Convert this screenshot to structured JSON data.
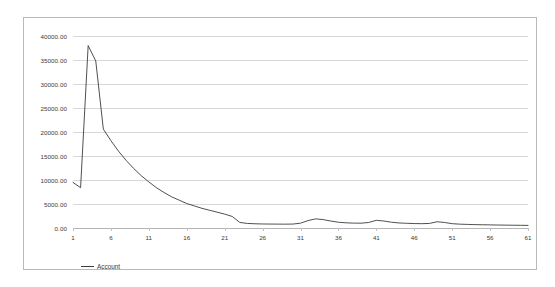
{
  "chart_data": {
    "type": "line",
    "title": "",
    "xlabel": "",
    "ylabel": "",
    "xlim": [
      1,
      61
    ],
    "ylim": [
      0,
      40000
    ],
    "grid": true,
    "legend_position": "bottom-left",
    "y_ticks": [
      40000,
      35000,
      30000,
      25000,
      20000,
      15000,
      10000,
      5000,
      0
    ],
    "y_tick_labels": [
      "40000.00",
      "35000.00",
      "30000.00",
      "25000.00",
      "20000.00",
      "15000.00",
      "10000.00",
      "5000.00",
      "0.00"
    ],
    "x_ticks": [
      1,
      6,
      11,
      16,
      21,
      26,
      31,
      36,
      41,
      46,
      51,
      56,
      61
    ],
    "x_tick_labels": [
      "1",
      "6",
      "11",
      "16",
      "21",
      "26",
      "31",
      "36",
      "41",
      "46",
      "51",
      "56",
      "61"
    ],
    "series": [
      {
        "name": "Account",
        "color": "#3c3c3c",
        "x": [
          1,
          2,
          3,
          4,
          5,
          6,
          7,
          8,
          9,
          10,
          11,
          12,
          13,
          14,
          15,
          16,
          17,
          18,
          19,
          20,
          21,
          22,
          23,
          24,
          25,
          26,
          27,
          28,
          29,
          30,
          31,
          32,
          33,
          34,
          35,
          36,
          37,
          38,
          39,
          40,
          41,
          42,
          43,
          44,
          45,
          46,
          47,
          48,
          49,
          50,
          51,
          52,
          53,
          54,
          55,
          56,
          57,
          58,
          59,
          60,
          61
        ],
        "values": [
          9500,
          8400,
          38000,
          34800,
          20600,
          18200,
          16000,
          14100,
          12400,
          10900,
          9600,
          8400,
          7400,
          6500,
          5800,
          5100,
          4600,
          4100,
          3700,
          3300,
          2900,
          2400,
          1150,
          950,
          880,
          840,
          820,
          810,
          800,
          820,
          1000,
          1550,
          1900,
          1750,
          1450,
          1200,
          1080,
          1020,
          1000,
          1150,
          1600,
          1450,
          1200,
          1050,
          980,
          930,
          900,
          950,
          1300,
          1150,
          900,
          800,
          750,
          700,
          680,
          650,
          620,
          600,
          580,
          560,
          540
        ]
      }
    ],
    "legend": [
      {
        "label": "Account",
        "color": "#3c3c3c"
      }
    ]
  },
  "colors": {
    "series": "#3c3c3c",
    "grid": "#d8d8d8",
    "axis": "#b5b5b5",
    "border": "#b9b9b9",
    "text": "#3a3a3a",
    "background": "#ffffff"
  }
}
